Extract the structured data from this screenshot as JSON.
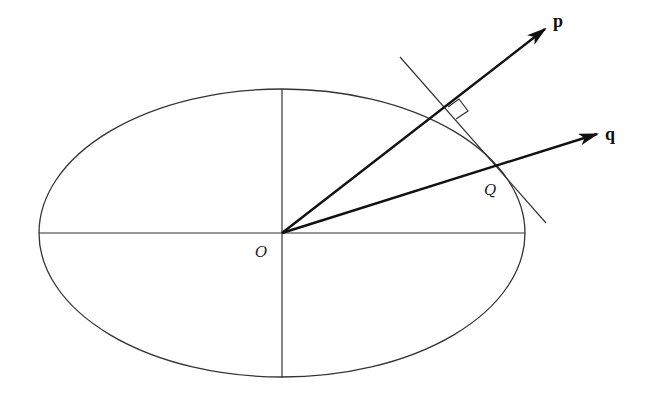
{
  "diagram": {
    "type": "geometry",
    "labels": {
      "origin": "O",
      "point": "Q",
      "vector_p": "p",
      "vector_q": "q"
    },
    "colors": {
      "stroke": "#333333",
      "arrow": "#111111",
      "background": "#ffffff"
    },
    "ellipse": {
      "cx": 282,
      "cy": 233,
      "rx": 243,
      "ry": 144
    },
    "vectors": [
      {
        "name": "p",
        "from": [
          282,
          233
        ],
        "to": [
          545,
          29
        ]
      },
      {
        "name": "q",
        "from": [
          282,
          233
        ],
        "to": [
          597,
          134
        ]
      }
    ],
    "tangent_line": {
      "from": [
        400,
        57
      ],
      "to": [
        546,
        223
      ]
    },
    "right_angle_marker": true
  }
}
